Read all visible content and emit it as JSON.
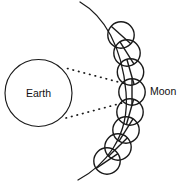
{
  "diagram": {
    "background_color": "#ffffff",
    "stroke_color": "#1a1a1a",
    "width": 182,
    "height": 182,
    "labels": {
      "earth": "Earth",
      "moon": "Moon"
    },
    "earth": {
      "name": "Earth",
      "cx": 38.5,
      "cy": 93,
      "r": 33.5,
      "label_x": 38.5,
      "label_y": 96.5
    },
    "moon_label": {
      "x": 150,
      "y": 95
    },
    "orbit_arc": {
      "description": "curved lunar orbit path passing through the chain of moon positions",
      "path": "M 80 2 C 104 16, 122 46, 126 92 C 130 138, 104 166, 78 180"
    },
    "sight_lines": [
      {
        "name": "upper-line-of-sight",
        "x1": 67.5,
        "y1": 68.5,
        "x2": 124,
        "y2": 83.5
      },
      {
        "name": "lower-line-of-sight",
        "x1": 66,
        "y1": 118,
        "x2": 124,
        "y2": 102.5
      }
    ],
    "moon_positions": [
      {
        "index": 1,
        "cx": 121.0,
        "cy": 35.0,
        "r": 13.2,
        "marker_angle_deg": -48
      },
      {
        "index": 2,
        "cx": 127.0,
        "cy": 53.0,
        "r": 13.2,
        "marker_angle_deg": -32
      },
      {
        "index": 3,
        "cx": 130.5,
        "cy": 72.0,
        "r": 13.2,
        "marker_angle_deg": -16
      },
      {
        "index": 4,
        "cx": 132.0,
        "cy": 92.0,
        "r": 13.2,
        "marker_angle_deg": 0
      },
      {
        "index": 5,
        "cx": 130.0,
        "cy": 112.0,
        "r": 13.2,
        "marker_angle_deg": 16
      },
      {
        "index": 6,
        "cx": 126.0,
        "cy": 130.0,
        "r": 13.2,
        "marker_angle_deg": 32
      },
      {
        "index": 7,
        "cx": 118.0,
        "cy": 147.0,
        "r": 13.2,
        "marker_angle_deg": 46
      },
      {
        "index": 8,
        "cx": 107.0,
        "cy": 161.0,
        "r": 13.2,
        "marker_angle_deg": 56
      }
    ]
  }
}
